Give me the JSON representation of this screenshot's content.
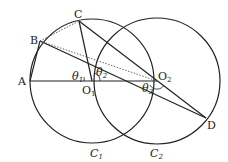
{
  "diagram": {
    "points": {
      "A": {
        "label": "A",
        "x": 30,
        "y": 81
      },
      "B": {
        "label": "B",
        "x": 40,
        "y": 41
      },
      "C": {
        "label": "C",
        "x": 79,
        "y": 21
      },
      "O1": {
        "label": "O",
        "sub": "1",
        "x": 92,
        "y": 81
      },
      "O2": {
        "label": "O",
        "sub": "2",
        "x": 157,
        "y": 81
      },
      "D": {
        "label": "D",
        "x": 206,
        "y": 118
      }
    },
    "circles": [
      {
        "name": "C1",
        "label": "C",
        "sub": "1",
        "cx": 92,
        "cy": 81,
        "r": 62
      },
      {
        "name": "C2",
        "label": "C",
        "sub": "2",
        "cx": 157,
        "cy": 81,
        "r": 63
      }
    ],
    "angles": [
      {
        "label": "θ",
        "sub": "1"
      },
      {
        "label": "θ",
        "sub": "2"
      },
      {
        "label": "θ",
        "sub": "3"
      }
    ],
    "colors": {
      "stroke": "#222222",
      "background": "#ffffff"
    }
  }
}
